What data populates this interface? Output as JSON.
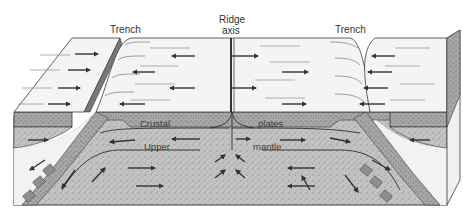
{
  "diagram": {
    "labels": {
      "trench_left": "Trench",
      "ridge_line1": "Ridge",
      "ridge_line2": "axis",
      "trench_right": "Trench",
      "crustal": "Crustal",
      "plates": "plates",
      "upper": "Upper",
      "mantle": "mantle"
    },
    "colors": {
      "surface": "#f4f4f4",
      "plate": "#a9a9a9",
      "mantle": "#c2c2c2",
      "line": "#3b3b3b",
      "arrow": "#333333",
      "side": "#ececec"
    },
    "motion": {
      "left_outer_plate": "right",
      "left_inner_plate": "left",
      "right_inner_plate": "right",
      "right_outer_plate": "left",
      "mantle_upwelling": "up"
    }
  }
}
